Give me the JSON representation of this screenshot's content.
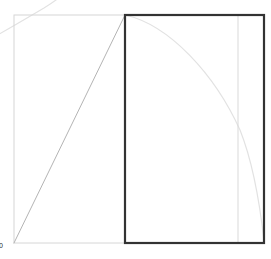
{
  "figure": {
    "canvas": {
      "width": 271,
      "height": 259,
      "background": "#ffffff"
    },
    "plot_area": {
      "x0": 14,
      "y0": 15,
      "x1": 264,
      "y1": 243
    },
    "origin_label": "0"
  },
  "colors": {
    "frame_stroke": "#d6d6d6",
    "gridline_stroke": "#d9d9d9",
    "curve_stroke": "#e2e2e2",
    "secant_stroke": "#b4b4b4",
    "highlight_rect_stroke": "#333333",
    "background": "#ffffff"
  },
  "strokes": {
    "frame_width": 1,
    "gridline_width": 1,
    "curve_width": 1.2,
    "secant_width": 1,
    "highlight_rect_width": 2.2
  },
  "chart_data": {
    "type": "line",
    "title": "",
    "subtitle": "",
    "xlabel": "",
    "ylabel": "",
    "xlim": [
      0,
      1
    ],
    "ylim": [
      0,
      1
    ],
    "grid": false,
    "legend": "none",
    "xticks": [],
    "yticks": [],
    "xticklabels": [],
    "yticklabels": [],
    "annotations": [],
    "series": [
      {
        "name": "concave-curve",
        "type": "line",
        "color": "#e2e2e2",
        "path": "M 125 15 C 170 25, 215 75, 240 130 C 252 160, 260 205, 264 241",
        "points": [
          [
            125,
            15
          ],
          [
            155,
            31
          ],
          [
            185,
            56
          ],
          [
            210,
            87
          ],
          [
            228,
            118
          ],
          [
            242,
            152
          ],
          [
            253,
            190
          ],
          [
            264,
            241
          ]
        ]
      },
      {
        "name": "corner-curve-clipped",
        "type": "line",
        "color": "#e2e2e2",
        "path": "M -22 46 C 0 34, 22 21, 44 8 C 52 3, 58 -1, 62 -5",
        "points": [
          [
            -22,
            46
          ],
          [
            0,
            33
          ],
          [
            20,
            21
          ],
          [
            40,
            9
          ],
          [
            58,
            -3
          ]
        ]
      },
      {
        "name": "secant-line",
        "type": "line",
        "color": "#b4b4b4",
        "path": "M 14 243 L 125 15",
        "points": [
          [
            14,
            243
          ],
          [
            125,
            15
          ]
        ]
      }
    ],
    "shapes": [
      {
        "name": "outer-frame",
        "type": "rect",
        "x": 14,
        "y": 15,
        "width": 250,
        "height": 228,
        "stroke": "#d6d6d6",
        "fill": "none"
      },
      {
        "name": "highlight-rect",
        "type": "rect",
        "x": 125,
        "y": 15,
        "width": 139,
        "height": 228,
        "stroke": "#333333",
        "fill": "none"
      },
      {
        "name": "inner-gridline",
        "type": "vline",
        "x": 238,
        "y_start": 16,
        "y_end": 242,
        "stroke": "#d9d9d9"
      }
    ]
  }
}
